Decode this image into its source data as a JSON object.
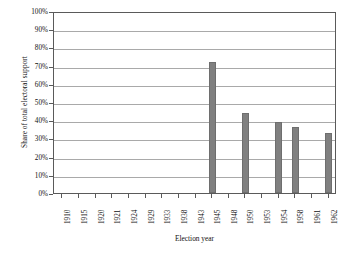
{
  "chart_data": {
    "type": "bar",
    "title": "",
    "subtitle": "",
    "xlabel": "Election year",
    "ylabel": "Share of total electoral support",
    "categories": [
      "1910",
      "1915",
      "1920",
      "1921",
      "1924",
      "1929",
      "1933",
      "1938",
      "1943",
      "1945",
      "1948",
      "1950",
      "1953",
      "1954",
      "1958",
      "1961",
      "1962"
    ],
    "values": [
      0,
      0,
      0,
      0,
      0,
      0,
      0,
      0,
      0,
      72,
      0,
      44,
      0,
      39,
      36,
      0,
      33
    ],
    "ylim": [
      0,
      100
    ],
    "ytick_labels": [
      "0%",
      "10%",
      "20%",
      "30%",
      "40%",
      "50%",
      "60%",
      "70%",
      "80%",
      "90%",
      "100%"
    ],
    "ytick_values": [
      0,
      10,
      20,
      30,
      40,
      50,
      60,
      70,
      80,
      90,
      100
    ],
    "grid": true,
    "grid_axis": "y",
    "legend": false,
    "legend_position": "none",
    "bar_color": "#808080",
    "bar_edge_color": "#6e6e6e",
    "gridline_color": "#a9a9a9",
    "axis_color": "#5a5a5a",
    "background_color": "#ffffff"
  }
}
